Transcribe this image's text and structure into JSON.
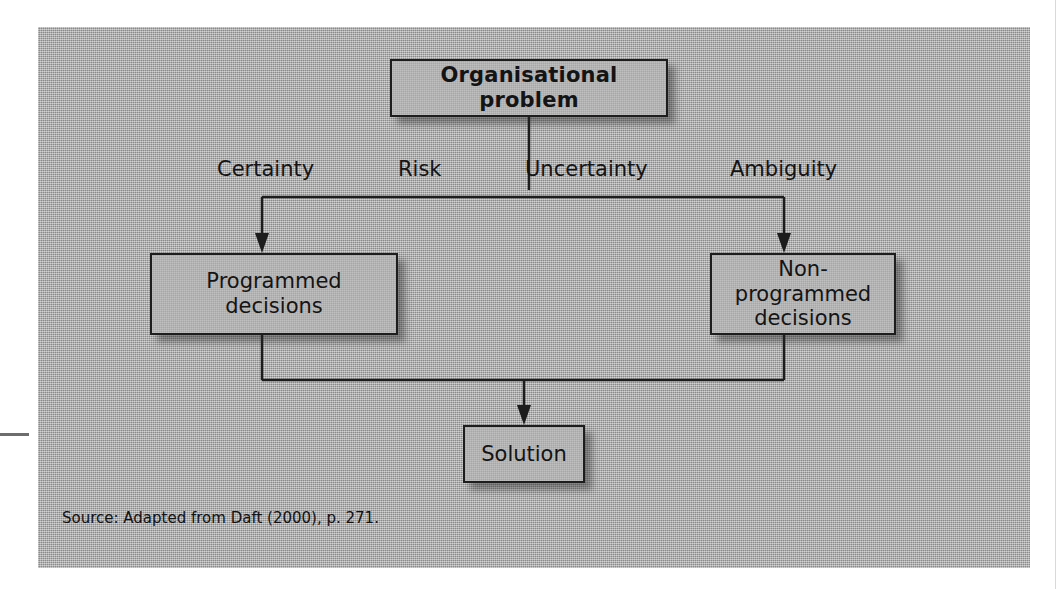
{
  "figure": {
    "root_node": {
      "label": "Organisational problem"
    },
    "condition_labels": [
      "Certainty",
      "Risk",
      "Uncertainty",
      "Ambiguity"
    ],
    "decision_nodes": [
      {
        "label": "Programmed\ndecisions",
        "line1": "Programmed",
        "line2": "decisions"
      },
      {
        "label": "Non-programmed\ndecisions",
        "line1": "Non-programmed",
        "line2": "decisions"
      }
    ],
    "outcome_node": {
      "label": "Solution"
    },
    "source": "Source: Adapted from Daft (2000), p. 271.",
    "colors": {
      "panel_background": "#a9a9a9",
      "box_outline": "#1d1d1d",
      "connector": "#1d1d1d",
      "text": "#141414",
      "page_background": "#ffffff"
    }
  }
}
